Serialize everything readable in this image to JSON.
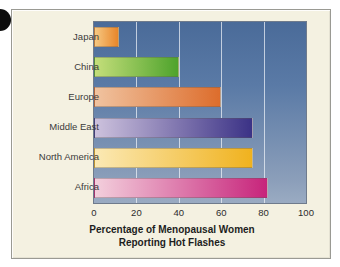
{
  "figure": {
    "marker_name": "corner-bullet",
    "panel_background": "#f4f1e1",
    "plot_background_top": "#4a6b99",
    "plot_background_bottom": "#9aabc2",
    "gridline_color": "#eef2f8",
    "axis_border_color": "#6f7b8c"
  },
  "chart_data": {
    "type": "bar",
    "orientation": "horizontal",
    "title": "",
    "xlabel_line1": "Percentage of Menopausal Women",
    "xlabel_line2": "Reporting Hot Flashes",
    "ylabel": "",
    "categories": [
      "Japan",
      "China",
      "Europe",
      "Middle East",
      "North America",
      "Africa"
    ],
    "values": [
      12,
      40,
      60,
      75,
      75,
      82
    ],
    "xlim": [
      0,
      100
    ],
    "xticks": [
      0,
      20,
      40,
      60,
      80,
      100
    ],
    "xtick_labels": [
      "0",
      "20",
      "40",
      "60",
      "80",
      "100"
    ],
    "grid": true,
    "grid_axis": "x",
    "legend": false,
    "bar_colors": [
      {
        "name": "Japan",
        "start": "#f6c882",
        "end": "#e8862a"
      },
      {
        "name": "China",
        "start": "#c4de7a",
        "end": "#4ea32c"
      },
      {
        "name": "Europe",
        "start": "#f0c3a0",
        "end": "#dd6d2c"
      },
      {
        "name": "Middle East",
        "start": "#cdc2dd",
        "end": "#3b3286"
      },
      {
        "name": "North America",
        "start": "#fbe9b4",
        "end": "#f0b21e"
      },
      {
        "name": "Africa",
        "start": "#f3cfdc",
        "end": "#c7247b"
      }
    ]
  }
}
